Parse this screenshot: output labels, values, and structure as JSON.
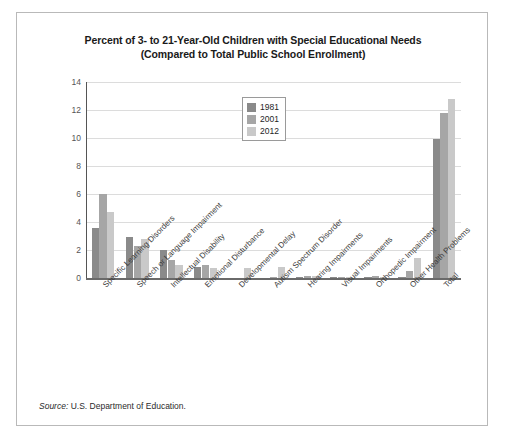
{
  "figure": {
    "title_line1": "Percent of 3- to 21-Year-Old Children with Special Educational Needs",
    "title_line2": "(Compared to Total Public School Enrollment)",
    "source_prefix": "Source:",
    "source_text": " U.S. Department of Education."
  },
  "legend": {
    "entries": [
      {
        "label": "1981",
        "color": "#8a8a8a"
      },
      {
        "label": "2001",
        "color": "#a6a6a6"
      },
      {
        "label": "2012",
        "color": "#c9c9c9"
      }
    ]
  },
  "chart_data": {
    "type": "bar",
    "title": "Percent of 3- to 21-Year-Old Children with Special Educational Needs (Compared to Total Public School Enrollment)",
    "xlabel": "",
    "ylabel": "",
    "ylim": [
      0,
      14
    ],
    "yticks": [
      0,
      2,
      4,
      6,
      8,
      10,
      12,
      14
    ],
    "ytick_labels": [
      "0",
      "2",
      "4",
      "6",
      "8",
      "10",
      "12",
      "14"
    ],
    "grid": true,
    "legend_position": "top-center",
    "categories": [
      "Specific Learning Disorders",
      "Speech or Language Impairment",
      "Intellectual Disability",
      "Emotional Disturbance",
      "Developmental Delay",
      "Autism Spectrum Disorder",
      "Hearing Impairments",
      "Visual Impairments",
      "Orthopedic Impairment",
      "Other Health Problems",
      "Total"
    ],
    "series": [
      {
        "name": "1981",
        "color": "#8a8a8a",
        "values": [
          3.6,
          2.9,
          2.0,
          0.8,
          0.0,
          0.0,
          0.1,
          0.1,
          0.1,
          0.1,
          9.9
        ]
      },
      {
        "name": "2001",
        "color": "#a6a6a6",
        "values": [
          6.0,
          2.3,
          1.3,
          0.9,
          0.0,
          0.1,
          0.15,
          0.05,
          0.15,
          0.5,
          11.8
        ]
      },
      {
        "name": "2012",
        "color": "#c9c9c9",
        "values": [
          4.7,
          2.8,
          0.9,
          0.7,
          0.7,
          0.8,
          0.15,
          0.05,
          0.1,
          1.4,
          12.8
        ]
      }
    ]
  }
}
